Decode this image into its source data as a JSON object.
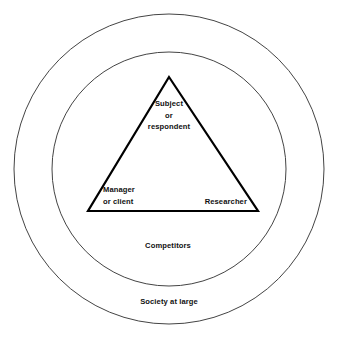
{
  "diagram": {
    "type": "concentric-circles-with-triangle",
    "background_color": "#ffffff",
    "line_color": "#000000",
    "ring_color": "#444444",
    "center": {
      "x": 169,
      "y": 169
    },
    "rings": [
      {
        "id": "outer-ring",
        "name": "society-ring",
        "radius": 155,
        "label": "Society at large",
        "label_position": {
          "x": 169,
          "y": 302
        }
      },
      {
        "id": "inner-ring",
        "name": "competitors-ring",
        "radius": 117,
        "label": "Competitors",
        "label_position": {
          "x": 168,
          "y": 246
        }
      }
    ],
    "triangle": {
      "id": "stakeholder-triangle",
      "stroke_width": 2.2,
      "vertices": [
        {
          "name": "apex",
          "x": 169,
          "y": 77
        },
        {
          "name": "bottom-left",
          "x": 88,
          "y": 211
        },
        {
          "name": "bottom-right",
          "x": 258,
          "y": 211
        }
      ],
      "corners": [
        {
          "id": "corner-subject",
          "position": "top",
          "lines": [
            "Subject",
            "or",
            "respondent"
          ]
        },
        {
          "id": "corner-manager",
          "position": "bottom-left",
          "lines": [
            "Manager",
            "or client"
          ]
        },
        {
          "id": "corner-researcher",
          "position": "bottom-right",
          "lines": [
            "Researcher"
          ]
        }
      ]
    }
  },
  "labels": {
    "subject_line1": "Subject",
    "subject_line2": "or",
    "subject_line3": "respondent",
    "manager_line1": "Manager",
    "manager_line2": "or client",
    "researcher": "Researcher",
    "competitors": "Competitors",
    "society": "Society at large"
  }
}
